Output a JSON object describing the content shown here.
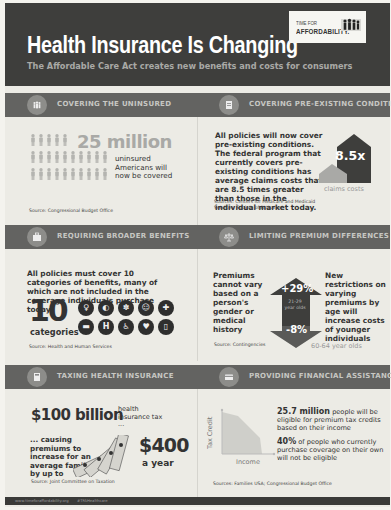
{
  "header": {
    "title": "Health Insurance Is Changing",
    "subtitle": "The Affordable Care Act creates new benefits and costs for consumers",
    "logo_line1": "TIME FOR",
    "logo_line2": "AFFORDABILITY."
  },
  "sections": [
    {
      "title": "COVERING THE UNINSURED",
      "icon": "people-icon",
      "big_number": "25 million",
      "text": "uninsured Americans will now be covered",
      "source": "Source: Congressional Budget Office"
    },
    {
      "title": "COVERING PRE-EXISTING CONDITIONS",
      "icon": "document-icon",
      "text": "All policies will now cover pre-existing conditions. The federal program that currently covers pre-existing conditions has average claims costs that are 8.5 times greater than those in the individual market today.",
      "multiplier": "8.5x",
      "multiplier_label": "claims costs",
      "source": "Sources: Centers for Medicare and Medicaid Services; Society of Actuaries"
    },
    {
      "title": "REQUIRING BROADER BENEFITS",
      "icon": "medical-kit-icon",
      "text": "All policies must cover 10 categories of benefits, many of which are not included in the coverage individuals purchase today",
      "big_number": "10",
      "big_label": "categories",
      "category_icons": [
        {
          "name": "maternity-icon",
          "glyph": "♀"
        },
        {
          "name": "pill-icon",
          "glyph": "◐"
        },
        {
          "name": "brain-icon",
          "glyph": "✽"
        },
        {
          "name": "child-icon",
          "glyph": "☺"
        },
        {
          "name": "fish-oil-icon",
          "glyph": "✚"
        },
        {
          "name": "ambulance-icon",
          "glyph": "▬"
        },
        {
          "name": "hospital-icon",
          "glyph": "H"
        },
        {
          "name": "rehab-icon",
          "glyph": "♿"
        },
        {
          "name": "heart-icon",
          "glyph": "♥"
        },
        {
          "name": "lab-icon",
          "glyph": "▯"
        }
      ],
      "source": "Source: Health and Human Services"
    },
    {
      "title": "LIMITING PREMIUM DIFFERENCES",
      "icon": "scales-icon",
      "text_left": "Premiums cannot vary based on a person's gender or medical history",
      "text_right": "New restrictions on varying premiums by age will increase costs of younger individuals",
      "up_value": "+29%",
      "up_label": "21-29 year olds",
      "down_value": "-8%",
      "down_label": "60-64 year olds",
      "source": "Source: Contingencies"
    },
    {
      "title": "TAXING HEALTH INSURANCE",
      "icon": "calculator-icon",
      "big_number": "$100 billion",
      "big_note": "health insurance tax ...",
      "text": "... causing premiums to increase for an average family by up to",
      "amount": "$400",
      "amount_label": "a year",
      "source": "Source: Joint Committee on Taxation"
    },
    {
      "title": "PROVIDING FINANCIAL ASSISTANCE",
      "icon": "credit-card-icon",
      "chart_ylabel": "Tax Credit",
      "chart_xlabel": "Income",
      "stat1_bold": "25.7 million",
      "stat1_text": " people will be eligible for premium tax credits based on their income",
      "stat2_bold": "40%",
      "stat2_text": " of people who currently purchase coverage on their own will not be eligible",
      "source": "Sources: Families USA; Congressional Budget Office"
    }
  ],
  "footer": {
    "website": "www.timeforaffordability.org",
    "hashtag": "#TFAHealthcare"
  },
  "colors": {
    "header_bg": "#3e3e3c",
    "bar_bg": "#636361",
    "panel_bg": "#ecebe5",
    "accent_gray": "#a9a9a6",
    "text_dark": "#333333"
  }
}
